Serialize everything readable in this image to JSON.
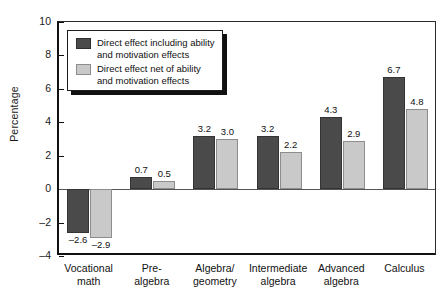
{
  "chart_data": {
    "type": "bar",
    "title": "",
    "xlabel": "",
    "ylabel": "Percentage",
    "ylim": [
      -4,
      10
    ],
    "yticks": [
      10,
      8,
      6,
      4,
      2,
      0,
      -2,
      -4
    ],
    "ytick_labels": [
      "10",
      "8",
      "6",
      "4",
      "2",
      "0",
      "–2",
      "–4"
    ],
    "grid": false,
    "legend_position": "upper-left-inside",
    "categories": [
      "Vocational\nmath",
      "Pre-\nalgebra",
      "Algebra/\ngeometry",
      "Intermediate\nalgebra",
      "Advanced\nalgebra",
      "Calculus"
    ],
    "category_lines": [
      [
        "Vocational",
        "math"
      ],
      [
        "Pre-",
        "algebra"
      ],
      [
        "Algebra/",
        "geometry"
      ],
      [
        "Intermediate",
        "algebra"
      ],
      [
        "Advanced",
        "algebra"
      ],
      [
        "Calculus",
        ""
      ]
    ],
    "series": [
      {
        "name": "Direct effect including ability and motivation effects",
        "name_lines": [
          "Direct effect including ability",
          "and motivation effects"
        ],
        "color": "#4a4a4a",
        "values": [
          -2.6,
          0.7,
          3.2,
          3.2,
          4.3,
          6.7
        ],
        "labels": [
          "–2.6",
          "0.7",
          "3.2",
          "3.2",
          "4.3",
          "6.7"
        ]
      },
      {
        "name": "Direct effect net of ability and motivation effects",
        "name_lines": [
          "Direct effect net of ability",
          "and motivation effects"
        ],
        "color": "#c9c9c9",
        "values": [
          -2.9,
          0.5,
          3.0,
          2.2,
          2.9,
          4.8
        ],
        "labels": [
          "–2.9",
          "0.5",
          "3.0",
          "2.2",
          "2.9",
          "4.8"
        ]
      }
    ]
  }
}
